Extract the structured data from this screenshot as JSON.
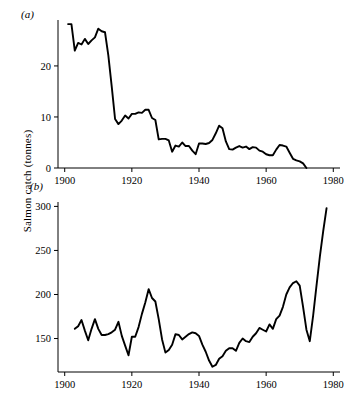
{
  "figure": {
    "ylabel": "Salmon catch (tonnes)",
    "panel_a_label": "(a)",
    "panel_b_label": "(b)"
  },
  "chart_data": [
    {
      "type": "line",
      "panel": "(a)",
      "title": "",
      "xlabel": "",
      "ylabel": "Salmon catch (tonnes)",
      "xlim": [
        1898,
        1982
      ],
      "ylim": [
        0,
        29
      ],
      "xticks": [
        1900,
        1920,
        1940,
        1960,
        1980
      ],
      "xticklabels": [
        "1900",
        "1920",
        "1940",
        "1960",
        "1980"
      ],
      "yticks": [
        0,
        10,
        20
      ],
      "yticklabels": [
        "0",
        "10",
        "20"
      ],
      "grid": false,
      "legend": "none",
      "x": [
        1901,
        1902,
        1903,
        1904,
        1905,
        1906,
        1907,
        1908,
        1909,
        1910,
        1911,
        1912,
        1913,
        1914,
        1915,
        1916,
        1917,
        1918,
        1919,
        1920,
        1921,
        1922,
        1923,
        1924,
        1925,
        1926,
        1927,
        1928,
        1929,
        1930,
        1931,
        1932,
        1933,
        1934,
        1935,
        1936,
        1937,
        1938,
        1939,
        1940,
        1941,
        1942,
        1943,
        1944,
        1945,
        1946,
        1947,
        1948,
        1949,
        1950,
        1951,
        1952,
        1953,
        1954,
        1955,
        1956,
        1957,
        1958,
        1959,
        1960,
        1961,
        1962,
        1963,
        1964,
        1965,
        1966,
        1967,
        1968,
        1969,
        1970,
        1971,
        1972
      ],
      "values": [
        28.2,
        28.2,
        23.0,
        24.5,
        24.2,
        25.3,
        24.3,
        25.0,
        25.6,
        27.3,
        26.8,
        26.6,
        22.0,
        16.0,
        9.6,
        8.6,
        9.3,
        10.3,
        9.7,
        10.6,
        10.6,
        10.9,
        10.8,
        11.4,
        11.4,
        9.8,
        9.4,
        5.6,
        5.7,
        5.7,
        5.4,
        3.2,
        4.4,
        4.2,
        5.0,
        4.3,
        4.3,
        3.4,
        2.7,
        4.8,
        4.8,
        4.7,
        4.9,
        5.5,
        6.8,
        8.3,
        7.8,
        5.2,
        3.7,
        3.6,
        4.0,
        4.3,
        4.0,
        4.2,
        3.7,
        4.1,
        4.0,
        3.4,
        3.2,
        2.7,
        2.5,
        2.5,
        3.6,
        4.5,
        4.4,
        4.2,
        3.0,
        1.8,
        1.5,
        1.3,
        0.9,
        0.0
      ]
    },
    {
      "type": "line",
      "panel": "(b)",
      "title": "",
      "xlabel": "",
      "ylabel": "Salmon catch (tonnes)",
      "xlim": [
        1898,
        1982
      ],
      "ylim": [
        112,
        305
      ],
      "xticks": [
        1900,
        1920,
        1940,
        1960,
        1980
      ],
      "xticklabels": [
        "1900",
        "1920",
        "1940",
        "1960",
        "1980"
      ],
      "yticks": [
        150,
        200,
        250,
        300
      ],
      "yticklabels": [
        "150",
        "200",
        "250",
        "300"
      ],
      "grid": false,
      "legend": "none",
      "x": [
        1903,
        1904,
        1905,
        1906,
        1907,
        1908,
        1909,
        1910,
        1911,
        1912,
        1913,
        1914,
        1915,
        1916,
        1917,
        1918,
        1919,
        1920,
        1921,
        1922,
        1923,
        1924,
        1925,
        1926,
        1927,
        1928,
        1929,
        1930,
        1931,
        1932,
        1933,
        1934,
        1935,
        1936,
        1937,
        1938,
        1939,
        1940,
        1941,
        1942,
        1943,
        1944,
        1945,
        1946,
        1947,
        1948,
        1949,
        1950,
        1951,
        1952,
        1953,
        1954,
        1955,
        1956,
        1957,
        1958,
        1959,
        1960,
        1961,
        1962,
        1963,
        1964,
        1965,
        1966,
        1967,
        1968,
        1969,
        1970,
        1971,
        1972,
        1973,
        1974,
        1975,
        1976,
        1977,
        1978
      ],
      "values": [
        161,
        164,
        171,
        159,
        148,
        161,
        172,
        161,
        154,
        154,
        155,
        157,
        160,
        169,
        153,
        142,
        131,
        152,
        152,
        163,
        178,
        191,
        206,
        196,
        192,
        172,
        149,
        134,
        137,
        143,
        155,
        154,
        149,
        152,
        155,
        157,
        156,
        153,
        143,
        135,
        125,
        118,
        120,
        127,
        130,
        136,
        139,
        139,
        136,
        145,
        150,
        147,
        146,
        152,
        156,
        162,
        160,
        158,
        166,
        161,
        172,
        176,
        186,
        200,
        208,
        213,
        215,
        210,
        186,
        160,
        147,
        176,
        210,
        243,
        272,
        298
      ]
    }
  ]
}
